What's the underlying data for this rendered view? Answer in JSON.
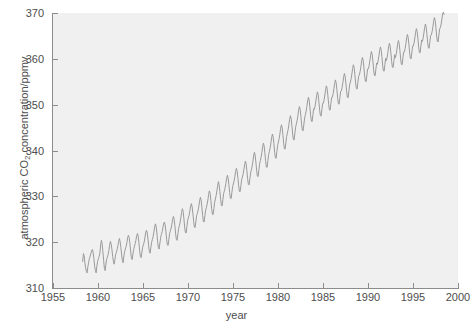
{
  "chart_data": {
    "type": "line",
    "title": "",
    "xlabel": "year",
    "ylabel": "atmospheric CO2 concentration/ppmv",
    "ylabel_parts": {
      "prefix": "atmospheric CO",
      "sub": "2",
      "suffix": " concentration/ppmv"
    },
    "xlim": [
      1955,
      2000
    ],
    "ylim": [
      310,
      370
    ],
    "xticks": [
      1955,
      1960,
      1965,
      1970,
      1975,
      1980,
      1985,
      1990,
      1995,
      2000
    ],
    "yticks": [
      310,
      320,
      330,
      340,
      350,
      360,
      370
    ],
    "grid": false,
    "legend": null,
    "series": [
      {
        "name": "Mauna Loa monthly mean CO2",
        "color": "#9a9a9a",
        "line_width": 1.0,
        "description": "Keeling curve: rising trend with annual seasonal sawtooth oscillation of about 6 ppmv peak-to-peak",
        "x": [
          1958.29,
          1958.38,
          1958.46,
          1958.54,
          1958.63,
          1958.71,
          1958.79,
          1958.88,
          1958.96,
          1959.04,
          1959.13,
          1959.21,
          1959.29,
          1959.38,
          1959.46,
          1959.54,
          1959.63,
          1959.71,
          1959.79,
          1959.88,
          1959.96,
          1960.04,
          1960.13,
          1960.21,
          1960.29,
          1960.38,
          1960.46,
          1960.54,
          1960.63,
          1960.71,
          1960.79,
          1960.88,
          1960.96,
          1961.04,
          1961.13,
          1961.21,
          1961.29,
          1961.38,
          1961.46,
          1961.54,
          1961.63,
          1961.71,
          1961.79,
          1961.88,
          1961.96,
          1962.04,
          1962.13,
          1962.21,
          1962.29,
          1962.38,
          1962.46,
          1962.54,
          1962.63,
          1962.71,
          1962.79,
          1962.88,
          1962.96,
          1963.04,
          1963.13,
          1963.21,
          1963.29,
          1963.38,
          1963.46,
          1963.54,
          1963.63,
          1963.71,
          1963.79,
          1963.88,
          1963.96,
          1964.04,
          1964.13,
          1964.21,
          1964.29,
          1964.38,
          1964.46,
          1964.54,
          1964.63,
          1964.71,
          1964.79,
          1964.88,
          1964.96,
          1965.04,
          1965.13,
          1965.21,
          1965.29,
          1965.38,
          1965.46,
          1965.54,
          1965.63,
          1965.71,
          1965.79,
          1965.88,
          1965.96,
          1966.04,
          1966.13,
          1966.21,
          1966.29,
          1966.38,
          1966.46,
          1966.54,
          1966.63,
          1966.71,
          1966.79,
          1966.88,
          1966.96,
          1967.04,
          1967.13,
          1967.21,
          1967.29,
          1967.38,
          1967.46,
          1967.54,
          1967.63,
          1967.71,
          1967.79,
          1967.88,
          1967.96,
          1968.04,
          1968.13,
          1968.21,
          1968.29,
          1968.38,
          1968.46,
          1968.54,
          1968.63,
          1968.71,
          1968.79,
          1968.88,
          1968.96,
          1969.04,
          1969.13,
          1969.21,
          1969.29,
          1969.38,
          1969.46,
          1969.54,
          1969.63,
          1969.71,
          1969.79,
          1969.88,
          1969.96,
          1970.04,
          1970.13,
          1970.21,
          1970.29,
          1970.38,
          1970.46,
          1970.54,
          1970.63,
          1970.71,
          1970.79,
          1970.88,
          1970.96,
          1971.04,
          1971.13,
          1971.21,
          1971.29,
          1971.38,
          1971.46,
          1971.54,
          1971.63,
          1971.71,
          1971.79,
          1971.88,
          1971.96,
          1972.04,
          1972.13,
          1972.21,
          1972.29,
          1972.38,
          1972.46,
          1972.54,
          1972.63,
          1972.71,
          1972.79,
          1972.88,
          1972.96,
          1973.04,
          1973.13,
          1973.21,
          1973.29,
          1973.38,
          1973.46,
          1973.54,
          1973.63,
          1973.71,
          1973.79,
          1973.88,
          1973.96,
          1974.04,
          1974.13,
          1974.21,
          1974.29,
          1974.38,
          1974.46,
          1974.54,
          1974.63,
          1974.71,
          1974.79,
          1974.88,
          1974.96,
          1975.04,
          1975.13,
          1975.21,
          1975.29,
          1975.38,
          1975.46,
          1975.54,
          1975.63,
          1975.71,
          1975.79,
          1975.88,
          1975.96,
          1976.04,
          1976.13,
          1976.21,
          1976.29,
          1976.38,
          1976.46,
          1976.54,
          1976.63,
          1976.71,
          1976.79,
          1976.88,
          1976.96,
          1977.04,
          1977.13,
          1977.21,
          1977.29,
          1977.38,
          1977.46,
          1977.54,
          1977.63,
          1977.71,
          1977.79,
          1977.88,
          1977.96,
          1978.04,
          1978.13,
          1978.21,
          1978.29,
          1978.38,
          1978.46,
          1978.54,
          1978.63,
          1978.71,
          1978.79,
          1978.88,
          1978.96,
          1979.04,
          1979.13,
          1979.21,
          1979.29,
          1979.38,
          1979.46,
          1979.54,
          1979.63,
          1979.71,
          1979.79,
          1979.88,
          1979.96,
          1980.04,
          1980.13,
          1980.21,
          1980.29,
          1980.38,
          1980.46,
          1980.54,
          1980.63,
          1980.71,
          1980.79,
          1980.88,
          1980.96,
          1981.04,
          1981.13,
          1981.21,
          1981.29,
          1981.38,
          1981.46,
          1981.54,
          1981.63,
          1981.71,
          1981.79,
          1981.88,
          1981.96,
          1982.04,
          1982.13,
          1982.21,
          1982.29,
          1982.38,
          1982.46,
          1982.54,
          1982.63,
          1982.71,
          1982.79,
          1982.88,
          1982.96,
          1983.04,
          1983.13,
          1983.21,
          1983.29,
          1983.38,
          1983.46,
          1983.54,
          1983.63,
          1983.71,
          1983.79,
          1983.88,
          1983.96,
          1984.04,
          1984.13,
          1984.21,
          1984.29,
          1984.38,
          1984.46,
          1984.54,
          1984.63,
          1984.71,
          1984.79,
          1984.88,
          1984.96,
          1985.04,
          1985.13,
          1985.21,
          1985.29,
          1985.38,
          1985.46,
          1985.54,
          1985.63,
          1985.71,
          1985.79,
          1985.88,
          1985.96,
          1986.04,
          1986.13,
          1986.21,
          1986.29,
          1986.38,
          1986.46,
          1986.54,
          1986.63,
          1986.71,
          1986.79,
          1986.88,
          1986.96,
          1987.04,
          1987.13,
          1987.21,
          1987.29,
          1987.38,
          1987.46,
          1987.54,
          1987.63,
          1987.71,
          1987.79,
          1987.88,
          1987.96,
          1988.04,
          1988.13,
          1988.21,
          1988.29,
          1988.38,
          1988.46,
          1988.54,
          1988.63,
          1988.71,
          1988.79,
          1988.88,
          1988.96,
          1989.04,
          1989.13,
          1989.21,
          1989.29,
          1989.38,
          1989.46,
          1989.54,
          1989.63,
          1989.71,
          1989.79,
          1989.88,
          1989.96,
          1990.04,
          1990.13,
          1990.21,
          1990.29,
          1990.38,
          1990.46,
          1990.54,
          1990.63,
          1990.71,
          1990.79,
          1990.88,
          1990.96,
          1991.04,
          1991.13,
          1991.21,
          1991.29,
          1991.38,
          1991.46,
          1991.54,
          1991.63,
          1991.71,
          1991.79,
          1991.88,
          1991.96,
          1992.04,
          1992.13,
          1992.21,
          1992.29,
          1992.38,
          1992.46,
          1992.54,
          1992.63,
          1992.71,
          1992.79,
          1992.88,
          1992.96,
          1993.04,
          1993.13,
          1993.21,
          1993.29,
          1993.38,
          1993.46,
          1993.54,
          1993.63,
          1993.71,
          1993.79,
          1993.88,
          1993.96,
          1994.04,
          1994.13,
          1994.21,
          1994.29,
          1994.38,
          1994.46,
          1994.54,
          1994.63,
          1994.71,
          1994.79,
          1994.88,
          1994.96,
          1995.04,
          1995.13,
          1995.21,
          1995.29,
          1995.38,
          1995.46,
          1995.54,
          1995.63,
          1995.71,
          1995.79,
          1995.88,
          1995.96,
          1996.04,
          1996.13,
          1996.21,
          1996.29,
          1996.38,
          1996.46,
          1996.54,
          1996.63,
          1996.71,
          1996.79,
          1996.88,
          1996.96,
          1997.04,
          1997.13,
          1997.21,
          1997.29,
          1997.38,
          1997.46,
          1997.54,
          1997.63,
          1997.71,
          1997.79,
          1997.88,
          1997.96,
          1998.04,
          1998.13,
          1998.21,
          1998.29,
          1998.38,
          1998.46
        ],
        "y": [
          315.7,
          317.5,
          317.1,
          315.5,
          314.4,
          313.6,
          313.3,
          314.7,
          315.6,
          316.4,
          316.9,
          317.5,
          318.1,
          318.4,
          317.7,
          316.5,
          314.7,
          313.8,
          313.3,
          314.8,
          315.8,
          316.4,
          316.9,
          317.6,
          319.4,
          320.4,
          319.6,
          318.0,
          316.0,
          314.3,
          313.8,
          315.2,
          316.3,
          316.7,
          317.3,
          318.2,
          319.3,
          320.2,
          319.6,
          318.5,
          316.9,
          315.8,
          315.2,
          316.2,
          317.3,
          317.8,
          318.4,
          319.2,
          320.1,
          320.8,
          320.1,
          318.8,
          317.2,
          316.0,
          315.5,
          317.0,
          318.0,
          318.5,
          319.1,
          319.9,
          321.0,
          321.5,
          321.0,
          319.8,
          317.9,
          316.6,
          316.2,
          317.4,
          318.4,
          319.0,
          319.7,
          320.4,
          321.3,
          321.9,
          321.4,
          320.0,
          318.1,
          316.9,
          316.6,
          317.8,
          318.9,
          319.4,
          320.0,
          320.9,
          322.0,
          322.6,
          322.2,
          320.9,
          319.2,
          317.9,
          317.6,
          318.9,
          320.0,
          320.6,
          321.3,
          322.2,
          323.3,
          324.0,
          323.5,
          322.0,
          320.1,
          318.8,
          318.5,
          319.8,
          321.0,
          321.7,
          322.3,
          323.1,
          324.0,
          324.4,
          323.8,
          322.4,
          320.6,
          319.4,
          319.3,
          320.7,
          321.9,
          322.5,
          323.1,
          323.9,
          325.0,
          325.6,
          325.0,
          323.6,
          321.8,
          320.6,
          320.4,
          321.8,
          323.0,
          323.6,
          324.4,
          325.4,
          326.5,
          327.3,
          326.7,
          325.2,
          323.3,
          322.1,
          322.0,
          323.4,
          324.7,
          325.3,
          325.9,
          326.8,
          327.9,
          328.4,
          327.7,
          326.3,
          324.5,
          323.3,
          323.2,
          324.6,
          325.8,
          326.3,
          327.0,
          327.9,
          329.0,
          329.8,
          329.2,
          327.6,
          325.8,
          324.5,
          324.4,
          325.8,
          327.0,
          327.6,
          328.3,
          329.2,
          330.4,
          331.2,
          330.6,
          329.1,
          327.3,
          326.1,
          326.0,
          327.4,
          328.7,
          329.4,
          330.2,
          331.2,
          332.3,
          333.2,
          332.5,
          331.1,
          329.3,
          328.0,
          327.9,
          329.3,
          330.6,
          331.2,
          331.9,
          332.8,
          333.9,
          334.6,
          334.0,
          332.6,
          330.8,
          329.6,
          329.5,
          330.9,
          332.1,
          332.7,
          333.4,
          334.3,
          335.4,
          336.1,
          335.5,
          334.1,
          332.3,
          331.1,
          331.0,
          332.4,
          333.6,
          334.2,
          334.9,
          335.8,
          336.9,
          337.7,
          337.1,
          335.6,
          333.8,
          332.6,
          332.5,
          333.9,
          335.1,
          335.8,
          336.6,
          337.6,
          338.8,
          339.6,
          339.0,
          337.5,
          335.6,
          334.4,
          334.3,
          335.8,
          337.1,
          337.8,
          338.6,
          339.6,
          340.8,
          341.6,
          341.0,
          339.5,
          337.6,
          336.4,
          336.3,
          337.8,
          339.1,
          339.8,
          340.6,
          341.6,
          342.8,
          343.6,
          343.0,
          341.5,
          339.6,
          338.4,
          338.3,
          339.8,
          341.1,
          341.8,
          342.6,
          343.6,
          344.8,
          345.6,
          345.0,
          343.5,
          341.6,
          340.4,
          340.3,
          341.8,
          343.1,
          343.8,
          344.6,
          345.6,
          346.8,
          347.6,
          347.0,
          345.5,
          343.6,
          342.4,
          342.3,
          343.8,
          345.1,
          345.8,
          346.6,
          347.6,
          348.8,
          349.6,
          349.0,
          347.5,
          345.6,
          344.4,
          344.3,
          345.8,
          347.1,
          347.8,
          348.6,
          349.6,
          350.8,
          351.6,
          351.0,
          349.5,
          347.6,
          346.4,
          346.3,
          347.8,
          349.1,
          349.0,
          349.8,
          350.8,
          352.0,
          352.8,
          352.2,
          350.7,
          348.8,
          347.6,
          347.5,
          349.0,
          350.3,
          350.3,
          351.1,
          352.1,
          353.3,
          354.1,
          353.5,
          352.0,
          350.1,
          348.9,
          348.8,
          350.3,
          351.6,
          351.6,
          352.4,
          353.4,
          354.6,
          355.4,
          354.8,
          353.3,
          351.4,
          350.2,
          350.1,
          351.6,
          352.9,
          353.0,
          353.8,
          354.8,
          356.0,
          356.8,
          356.2,
          354.7,
          352.8,
          351.6,
          351.5,
          353.0,
          354.3,
          354.9,
          355.7,
          356.7,
          357.9,
          358.7,
          358.1,
          356.6,
          354.7,
          353.5,
          353.4,
          354.9,
          356.2,
          356.5,
          357.3,
          358.3,
          359.5,
          360.3,
          359.7,
          358.2,
          356.3,
          355.1,
          355.0,
          356.5,
          357.8,
          357.8,
          358.6,
          359.6,
          360.8,
          361.6,
          361.0,
          359.5,
          357.6,
          356.4,
          356.3,
          357.8,
          359.1,
          358.8,
          359.6,
          360.6,
          361.8,
          362.6,
          362.0,
          360.5,
          358.6,
          357.4,
          357.3,
          358.8,
          360.1,
          359.6,
          360.4,
          361.4,
          362.6,
          363.4,
          362.8,
          361.3,
          359.4,
          358.2,
          358.1,
          359.6,
          360.9,
          360.2,
          361.0,
          362.0,
          363.2,
          364.0,
          363.4,
          361.9,
          360.0,
          358.8,
          358.7,
          360.2,
          361.5,
          361.5,
          362.3,
          363.3,
          364.5,
          365.3,
          364.7,
          363.2,
          361.3,
          360.1,
          360.0,
          361.5,
          362.8,
          362.8,
          363.6,
          364.6,
          365.8,
          366.6,
          366.0,
          364.5,
          362.6,
          361.4,
          361.3,
          362.8,
          364.1,
          363.8,
          364.6,
          365.6,
          366.8,
          367.6,
          367.0,
          365.5,
          363.6,
          362.4,
          362.3,
          363.8,
          365.1,
          365.2,
          366.0,
          367.0,
          368.2,
          369.0,
          368.4,
          366.9,
          365.0,
          363.8,
          363.7,
          365.2,
          366.5,
          366.8,
          367.6,
          368.6,
          369.8,
          370.2,
          369.6
        ]
      }
    ]
  },
  "axes": {
    "y_tick_labels": [
      "370",
      "360",
      "350",
      "340",
      "330",
      "320",
      "310"
    ],
    "x_tick_labels": [
      "1955",
      "1960",
      "1965",
      "1970",
      "1975",
      "1980",
      "1985",
      "1990",
      "1995",
      "2000"
    ],
    "x_axis_title": "year"
  },
  "style": {
    "panel_color": "#f0f0f0",
    "axis_color": "#8c8c8c",
    "text_color": "#4d4d4d",
    "line_color": "#9a9a9a",
    "page_background": "#ffffff"
  }
}
